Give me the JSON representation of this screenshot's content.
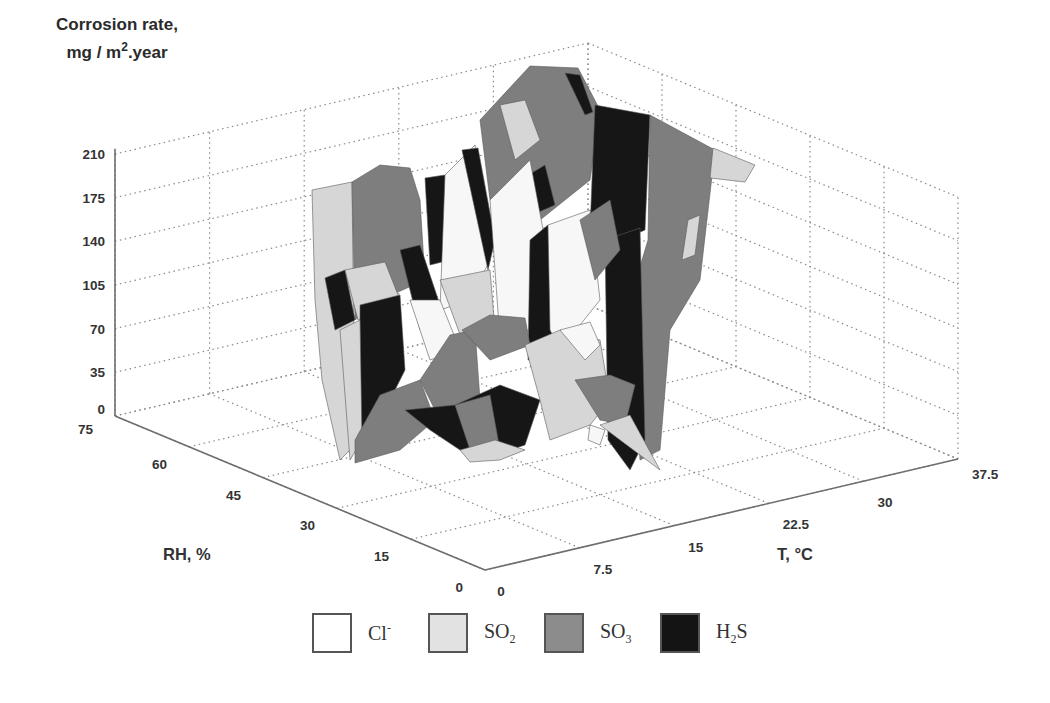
{
  "chart_data": {
    "type": "surface3d",
    "title": "",
    "zlabel_line1": "Corrosion rate,",
    "zlabel_line2_pre": "mg / m",
    "zlabel_line2_sup": "2",
    "zlabel_line2_post": ".year",
    "xlabel": "T, °C",
    "ylabel": "RH, %",
    "z_ticks": [
      "0",
      "35",
      "70",
      "105",
      "140",
      "175",
      "210"
    ],
    "z_range": [
      0,
      210
    ],
    "rh_ticks": [
      "0",
      "15",
      "30",
      "45",
      "60",
      "75"
    ],
    "rh_range": [
      0,
      75
    ],
    "t_ticks": [
      "0",
      "7.5",
      "15",
      "22.5",
      "30",
      "37.5"
    ],
    "t_range": [
      0,
      37.5
    ],
    "grid": true,
    "legend_position": "bottom",
    "legend": [
      {
        "label": "Cl",
        "sup": "-",
        "sub": "",
        "color": "#ffffff"
      },
      {
        "label": "SO",
        "sup": "",
        "sub": "2",
        "color": "#e2e2e2"
      },
      {
        "label": "SO",
        "sup": "",
        "sub": "3",
        "color": "#8c8c8c"
      },
      {
        "label": "H",
        "sup": "",
        "sub": "2",
        "post": "S",
        "color": "#141414"
      }
    ],
    "colors": {
      "Cl-": "#f7f7f7",
      "SO2": "#d6d6d6",
      "SO3": "#7e7e7e",
      "H2S": "#161616"
    }
  }
}
